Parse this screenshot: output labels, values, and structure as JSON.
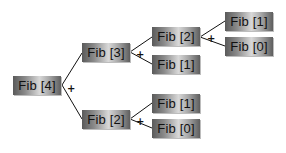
{
  "diagram": {
    "operator": "+",
    "nodes": {
      "fib4": "Fib [4]",
      "fib3": "Fib [3]",
      "fib2_upper": "Fib [2]",
      "fib1_mid": "Fib [1]",
      "fib1_top": "Fib [1]",
      "fib0_top": "Fib [0]",
      "fib2_lower": "Fib [2]",
      "fib1_bottom": "Fib [1]",
      "fib0_bottom": "Fib [0]"
    },
    "edges": [
      [
        "fib4",
        "fib3"
      ],
      [
        "fib4",
        "fib2_lower"
      ],
      [
        "fib3",
        "fib2_upper"
      ],
      [
        "fib3",
        "fib1_mid"
      ],
      [
        "fib2_upper",
        "fib1_top"
      ],
      [
        "fib2_upper",
        "fib0_top"
      ],
      [
        "fib2_lower",
        "fib1_bottom"
      ],
      [
        "fib2_lower",
        "fib0_bottom"
      ]
    ]
  }
}
